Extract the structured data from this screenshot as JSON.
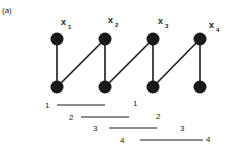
{
  "figure": {
    "caption": "(a)",
    "nodes_top": [
      {
        "id": "x1",
        "label": "x",
        "sub": "1",
        "cx": 57,
        "cy": 39
      },
      {
        "id": "x2",
        "label": "x",
        "sub": "2",
        "cx": 105,
        "cy": 39
      },
      {
        "id": "x3",
        "label": "x",
        "sub": "3",
        "cx": 153,
        "cy": 39
      },
      {
        "id": "x4",
        "label": "x",
        "sub": "4",
        "cx": 200,
        "cy": 39
      }
    ],
    "nodes_bottom": [
      {
        "id": "y1",
        "cx": 57,
        "cy": 87
      },
      {
        "id": "y2",
        "cx": 105,
        "cy": 87
      },
      {
        "id": "y3",
        "cx": 153,
        "cy": 87
      },
      {
        "id": "y4",
        "cx": 200,
        "cy": 87
      }
    ],
    "edges": [
      [
        "x1",
        "y1"
      ],
      [
        "x2",
        "y2"
      ],
      [
        "x3",
        "y3"
      ],
      [
        "x4",
        "y4"
      ],
      [
        "y1",
        "x2"
      ],
      [
        "y2",
        "x3"
      ],
      [
        "y3",
        "x4"
      ]
    ],
    "intervals": [
      {
        "left_label": "1",
        "right_label": "1"
      },
      {
        "left_label": "2",
        "right_label": "2"
      },
      {
        "left_label": "3",
        "right_label": "3"
      },
      {
        "left_label": "4",
        "right_label": "4"
      }
    ],
    "node_color": "#1a1a1a",
    "line_color": "#1a1a1a"
  }
}
